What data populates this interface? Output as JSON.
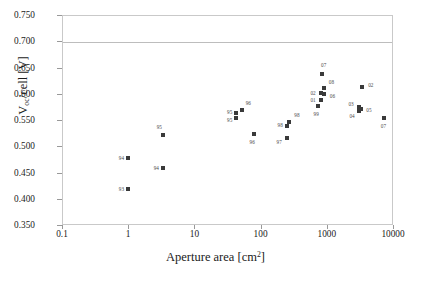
{
  "chart_data": {
    "type": "scatter",
    "title": "",
    "xlabel": "Aperture area [cm2]",
    "xlabel_base": "Aperture area [cm",
    "xlabel_sup": "2",
    "xlabel_tail": "]",
    "ylabel_base": "V",
    "ylabel_sub": "oc",
    "ylabel_tail": "/cell [V]",
    "ylabel": "Voc/cell [V]",
    "xscale": "log",
    "yscale": "linear",
    "xlim": [
      0.1,
      10000
    ],
    "ylim": [
      0.35,
      0.75
    ],
    "grid": "single horizontal gridline at 0.700",
    "legend": "none",
    "xticks": [
      "0.1",
      "1",
      "10",
      "100",
      "1000",
      "10000"
    ],
    "xtick_values": [
      0.1,
      1,
      10,
      100,
      1000,
      10000
    ],
    "yticks": [
      "0.350",
      "0.400",
      "0.450",
      "0.500",
      "0.550",
      "0.600",
      "0.650",
      "0.700",
      "0.750"
    ],
    "ytick_values": [
      0.35,
      0.4,
      0.45,
      0.5,
      0.55,
      0.6,
      0.65,
      0.7,
      0.75
    ],
    "gridline_values": [
      0.7
    ],
    "marker_color": "#3a3a3a",
    "marker_shape": "square",
    "label_color": "#4a4a4a",
    "points": [
      {
        "label": "93",
        "x": 0.95,
        "y": 0.42,
        "lx": -9,
        "ly": 0
      },
      {
        "label": "94",
        "x": 0.95,
        "y": 0.479,
        "lx": -9,
        "ly": 0
      },
      {
        "label": "94",
        "x": 3.2,
        "y": 0.461,
        "lx": -9,
        "ly": 0
      },
      {
        "label": "95",
        "x": 3.2,
        "y": 0.523,
        "lx": -6,
        "ly": -8
      },
      {
        "label": "95",
        "x": 41,
        "y": 0.565,
        "lx": -9,
        "ly": -1
      },
      {
        "label": "95",
        "x": 41,
        "y": 0.556,
        "lx": -9,
        "ly": 2
      },
      {
        "label": "96",
        "x": 50,
        "y": 0.571,
        "lx": 4,
        "ly": -7
      },
      {
        "label": "96",
        "x": 78,
        "y": 0.526,
        "lx": -5,
        "ly": 8
      },
      {
        "label": "97",
        "x": 238,
        "y": 0.518,
        "lx": -10,
        "ly": 4
      },
      {
        "label": "98",
        "x": 238,
        "y": 0.54,
        "lx": -9,
        "ly": -1
      },
      {
        "label": "98",
        "x": 262,
        "y": 0.549,
        "lx": 5,
        "ly": -7
      },
      {
        "label": "99",
        "x": 700,
        "y": 0.578,
        "lx": -4,
        "ly": 8
      },
      {
        "label": "01",
        "x": 800,
        "y": 0.59,
        "lx": -11,
        "ly": 0
      },
      {
        "label": "02",
        "x": 800,
        "y": 0.604,
        "lx": -11,
        "ly": 0
      },
      {
        "label": "06",
        "x": 870,
        "y": 0.601,
        "lx": 6,
        "ly": 2
      },
      {
        "label": "08",
        "x": 870,
        "y": 0.612,
        "lx": 5,
        "ly": -6
      },
      {
        "label": "07",
        "x": 820,
        "y": 0.64,
        "lx": -1,
        "ly": -9
      },
      {
        "label": "03",
        "x": 3000,
        "y": 0.576,
        "lx": -11,
        "ly": -3
      },
      {
        "label": "04",
        "x": 3000,
        "y": 0.57,
        "lx": -10,
        "ly": 5
      },
      {
        "label": "05",
        "x": 3200,
        "y": 0.573,
        "lx": 5,
        "ly": 1
      },
      {
        "label": "02",
        "x": 3300,
        "y": 0.614,
        "lx": 6,
        "ly": -2
      },
      {
        "label": "07",
        "x": 7000,
        "y": 0.556,
        "lx": -3,
        "ly": 8
      }
    ]
  }
}
